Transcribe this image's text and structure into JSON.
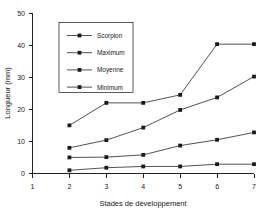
{
  "chart_data": {
    "type": "line",
    "title": "",
    "xlabel": "Stades de développement",
    "ylabel": "Longueur (mm)",
    "x": [
      2,
      3,
      4,
      5,
      6,
      7
    ],
    "xticks": [
      1,
      2,
      3,
      4,
      5,
      6,
      7
    ],
    "yticks": [
      0,
      10,
      20,
      30,
      40,
      50
    ],
    "xlim": [
      1,
      7
    ],
    "ylim": [
      0,
      50
    ],
    "grid": false,
    "legend_position": "upper left",
    "marker": "square",
    "series": [
      {
        "name": "Scorpion",
        "values": [
          15.0,
          22.0,
          22.0,
          24.5,
          40.3,
          40.3
        ]
      },
      {
        "name": "Maximum",
        "values": [
          8.0,
          10.4,
          14.3,
          19.8,
          23.7,
          30.2
        ]
      },
      {
        "name": "Moyenne",
        "values": [
          5.0,
          5.1,
          5.8,
          8.7,
          10.5,
          12.8
        ]
      },
      {
        "name": "Minimum",
        "values": [
          1.0,
          1.8,
          2.2,
          2.2,
          2.9,
          2.9
        ]
      }
    ]
  },
  "colors": {
    "line": "#333333",
    "marker": "#1a1a1a",
    "axis": "#222222",
    "background": "#ffffff"
  }
}
